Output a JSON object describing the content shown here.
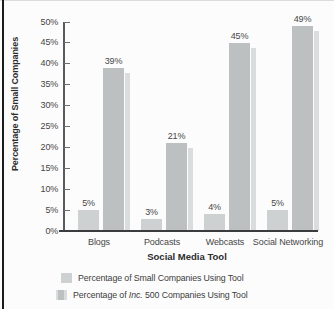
{
  "figure": {
    "y_axis_title": "Percentage of Small Companies",
    "x_axis_title": "Social Media Tool"
  },
  "chart_data": {
    "type": "bar",
    "categories": [
      "Blogs",
      "Podcasts",
      "Webcasts",
      "Social Networking"
    ],
    "series": [
      {
        "name": "Percentage of Small Companies Using Tool",
        "values": [
          5,
          3,
          4,
          5
        ]
      },
      {
        "name": "Percentage of Inc. 500 Companies Using Tool",
        "values": [
          39,
          21,
          45,
          49
        ]
      }
    ],
    "value_labels": [
      [
        "5%",
        "3%",
        "4%",
        "5%"
      ],
      [
        "39%",
        "21%",
        "45%",
        "49%"
      ]
    ],
    "title": "",
    "xlabel": "Social Media Tool",
    "ylabel": "Percentage of Small Companies",
    "ylim": [
      0,
      50
    ],
    "ytick_step": 5,
    "ytick_labels": [
      "0%",
      "5%",
      "10%",
      "15%",
      "20%",
      "25%",
      "30%",
      "35%",
      "40%",
      "45%",
      "50%"
    ],
    "grid": false,
    "legend_position": "bottom-left",
    "colors": {
      "small_companies_bar": "#cdd1d1",
      "inc_500_bar": "#bcc0c0",
      "bar_shadow": "#dadddd",
      "axis": "#3b3c3e",
      "text": "#3e3e3e"
    }
  },
  "legend": {
    "row1": {
      "label": "Percentage of Small Companies Using Tool"
    },
    "row2": {
      "prefix": "Percentage of ",
      "italic": "Inc.",
      "suffix": " 500 Companies Using Tool"
    }
  }
}
